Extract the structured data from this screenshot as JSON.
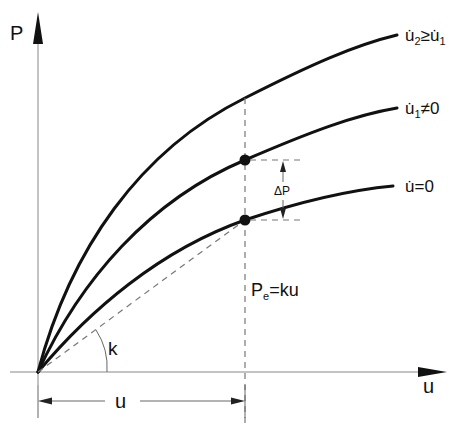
{
  "diagram": {
    "axes": {
      "y_label": "P",
      "x_label": "u"
    },
    "curves": [
      {
        "id": "top",
        "label": "u̇₂≥u̇₁",
        "label_main": "u̇",
        "label_sub": "2",
        "label_rel": "≥",
        "label_main2": "u̇",
        "label_sub2": "1"
      },
      {
        "id": "middle",
        "label": "u̇₁≠0",
        "label_main": "u̇",
        "label_sub": "1",
        "label_rel": "≠0"
      },
      {
        "id": "bottom",
        "label": "u̇=0",
        "label_main": "u̇",
        "label_rel": "=0"
      }
    ],
    "annotations": {
      "delta_p": "ΔP",
      "stiffness": "k",
      "elastic_force_main": "P",
      "elastic_force_sub": "e",
      "elastic_force_rest": "=ku",
      "displacement": "u"
    },
    "colors": {
      "curve": "#111111",
      "axis": "#888888",
      "dashed": "#777777"
    }
  }
}
